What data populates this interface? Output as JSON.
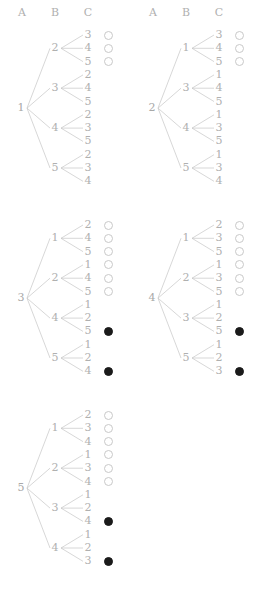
{
  "figure": {
    "type": "diagram",
    "columns": [
      "A",
      "B",
      "C"
    ],
    "headers": [
      {
        "label": "A",
        "x": 22,
        "y": 13
      },
      {
        "label": "B",
        "x": 55,
        "y": 13
      },
      {
        "label": "C",
        "x": 88,
        "y": 13
      },
      {
        "label": "A",
        "x": 153,
        "y": 13
      },
      {
        "label": "B",
        "x": 186,
        "y": 13
      },
      {
        "label": "C",
        "x": 219,
        "y": 13
      }
    ],
    "colors": {
      "line": "#c6c6c6",
      "text": "#b0b0b0",
      "circle_open_stroke": "#c9c9c9",
      "circle_filled": "#1a1a1a",
      "background": "#ffffff"
    },
    "circle_states": [
      "open",
      "filled",
      "none"
    ],
    "trees": [
      {
        "id": "tree-1",
        "root": "1",
        "origin_x": 0,
        "origin_y": 30,
        "branches": [
          {
            "b": "2",
            "c": [
              "3",
              "4",
              "5"
            ]
          },
          {
            "b": "3",
            "c": [
              "2",
              "4",
              "5"
            ]
          },
          {
            "b": "4",
            "c": [
              "2",
              "3",
              "5"
            ]
          },
          {
            "b": "5",
            "c": [
              "2",
              "3",
              "4"
            ]
          }
        ],
        "markers": [
          "open",
          "open",
          "open",
          "none",
          "none",
          "none",
          "none",
          "none",
          "none",
          "none",
          "none",
          "none"
        ]
      },
      {
        "id": "tree-2",
        "root": "2",
        "origin_x": 131,
        "origin_y": 30,
        "branches": [
          {
            "b": "1",
            "c": [
              "3",
              "4",
              "5"
            ]
          },
          {
            "b": "3",
            "c": [
              "1",
              "4",
              "5"
            ]
          },
          {
            "b": "4",
            "c": [
              "1",
              "3",
              "5"
            ]
          },
          {
            "b": "5",
            "c": [
              "1",
              "3",
              "4"
            ]
          }
        ],
        "markers": [
          "open",
          "open",
          "open",
          "none",
          "none",
          "none",
          "none",
          "none",
          "none",
          "none",
          "none",
          "none"
        ]
      },
      {
        "id": "tree-3",
        "root": "3",
        "origin_x": 0,
        "origin_y": 220,
        "branches": [
          {
            "b": "1",
            "c": [
              "2",
              "4",
              "5"
            ]
          },
          {
            "b": "2",
            "c": [
              "1",
              "4",
              "5"
            ]
          },
          {
            "b": "4",
            "c": [
              "1",
              "2",
              "5"
            ]
          },
          {
            "b": "5",
            "c": [
              "1",
              "2",
              "4"
            ]
          }
        ],
        "markers": [
          "open",
          "open",
          "open",
          "open",
          "open",
          "open",
          "none",
          "none",
          "filled",
          "none",
          "none",
          "filled"
        ]
      },
      {
        "id": "tree-4",
        "root": "4",
        "origin_x": 131,
        "origin_y": 220,
        "branches": [
          {
            "b": "1",
            "c": [
              "2",
              "3",
              "5"
            ]
          },
          {
            "b": "2",
            "c": [
              "1",
              "3",
              "5"
            ]
          },
          {
            "b": "3",
            "c": [
              "1",
              "2",
              "5"
            ]
          },
          {
            "b": "5",
            "c": [
              "1",
              "2",
              "3"
            ]
          }
        ],
        "markers": [
          "open",
          "open",
          "open",
          "open",
          "open",
          "open",
          "none",
          "none",
          "filled",
          "none",
          "none",
          "filled"
        ]
      },
      {
        "id": "tree-5",
        "root": "5",
        "origin_x": 0,
        "origin_y": 410,
        "branches": [
          {
            "b": "1",
            "c": [
              "2",
              "3",
              "4"
            ]
          },
          {
            "b": "2",
            "c": [
              "1",
              "3",
              "4"
            ]
          },
          {
            "b": "3",
            "c": [
              "1",
              "2",
              "4"
            ]
          },
          {
            "b": "4",
            "c": [
              "1",
              "2",
              "3"
            ]
          }
        ],
        "markers": [
          "open",
          "open",
          "open",
          "open",
          "open",
          "open",
          "none",
          "none",
          "filled",
          "none",
          "none",
          "filled"
        ]
      }
    ],
    "geometry": {
      "row_spacing": 13.3,
      "col_a_x": 21,
      "col_b_x": 55,
      "col_c_x": 88,
      "circle_x": 104,
      "circle_size": 9
    }
  }
}
